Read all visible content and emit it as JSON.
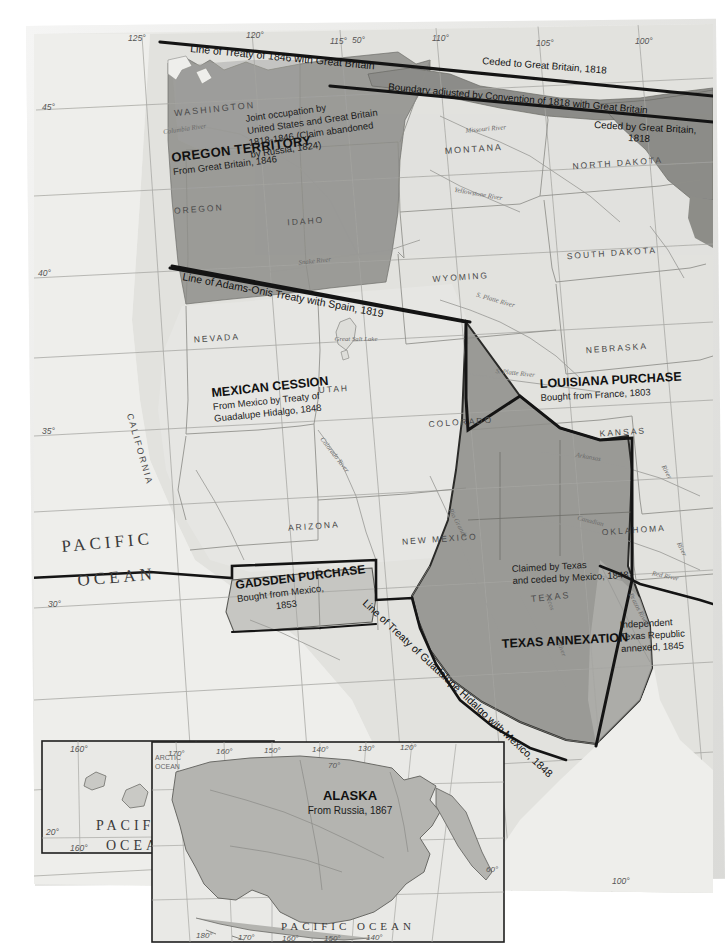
{
  "map": {
    "title": "United States Territorial Expansion",
    "colors": {
      "paper": "#e9e9e7",
      "land_light": "#e3e3e0",
      "land_mid": "#c9c9c5",
      "territory_dark": "#9a9a96",
      "territory_darker": "#8c8c88",
      "water": "#efefec",
      "boundary_heavy": "#111111",
      "state_line": "#8a8a86",
      "grid_line": "#9a9a96",
      "river": "#8f8f8b",
      "text": "#1a1a1a",
      "state_text": "#4a4a4a"
    },
    "territories": [
      {
        "id": "oregon-territory",
        "title": "OREGON TERRITORY",
        "subtitle": "From Great Britain, 1846",
        "shade": "dark"
      },
      {
        "id": "joint-occupation-note",
        "title": "Joint occupation by",
        "lines": [
          "Joint occupation by",
          "United States and Great Britain",
          "1818-1846 (Claim abandoned",
          "by Russia, 1824)"
        ],
        "shade": "note"
      },
      {
        "id": "mexican-cession",
        "title": "MEXICAN CESSION",
        "subtitle_lines": [
          "From Mexico by Treaty of",
          "Guadalupe Hidalgo, 1848"
        ],
        "shade": "light"
      },
      {
        "id": "louisiana-purchase",
        "title": "LOUISIANA PURCHASE",
        "subtitle": "Bought from France, 1803",
        "shade": "light"
      },
      {
        "id": "gadsden-purchase",
        "title": "GADSDEN PURCHASE",
        "subtitle_lines": [
          "Bought from Mexico,",
          "1853"
        ],
        "shade": "mid"
      },
      {
        "id": "texas-annexation",
        "title": "TEXAS ANNEXATION",
        "subtitle_lines": [
          "Independent",
          "Texas Republic",
          "annexed, 1845"
        ],
        "shade": "dark"
      },
      {
        "id": "claimed-by-texas",
        "lines": [
          "Claimed by Texas",
          "and ceded by Mexico, 1848"
        ],
        "shade": "dark"
      },
      {
        "id": "hawaii",
        "title": "HAWAII",
        "subtitle": "Annexed, 1898",
        "shade": "inset"
      },
      {
        "id": "alaska",
        "title": "ALASKA",
        "subtitle": "From Russia, 1867",
        "shade": "inset"
      }
    ],
    "boundary_annotations": [
      {
        "id": "treaty-1846",
        "text": "Line of Treaty of 1846 with Great Britain"
      },
      {
        "id": "ceded-to-gb-1818",
        "text": "Ceded to Great Britain, 1818"
      },
      {
        "id": "convention-1818",
        "text": "Boundary adjusted by Convention of 1818 with Great Britain"
      },
      {
        "id": "ceded-by-gb-1818",
        "lines": [
          "Ceded by Great Britain,",
          "1818"
        ]
      },
      {
        "id": "adams-onis-1819",
        "text": "Line of Adams-Onis Treaty with Spain, 1819"
      },
      {
        "id": "guadalupe-hidalgo-1848",
        "text": "Line of Treaty of Guadalupe Hidalgo with Mexico, 1848"
      }
    ],
    "states": [
      {
        "name": "WASHINGTON",
        "x": 215,
        "y": 112,
        "rot": -6,
        "size": 9
      },
      {
        "name": "OREGON",
        "x": 199,
        "y": 212,
        "rot": -4,
        "size": 8.5
      },
      {
        "name": "IDAHO",
        "x": 306,
        "y": 224,
        "rot": -4,
        "size": 8.5
      },
      {
        "name": "MONTANA",
        "x": 474,
        "y": 152,
        "rot": -4,
        "size": 9
      },
      {
        "name": "NORTH DAKOTA",
        "x": 618,
        "y": 166,
        "rot": -4,
        "size": 8.5
      },
      {
        "name": "SOUTH DAKOTA",
        "x": 612,
        "y": 256,
        "rot": -4,
        "size": 8.5
      },
      {
        "name": "WYOMING",
        "x": 461,
        "y": 280,
        "rot": -4,
        "size": 8.5
      },
      {
        "name": "NEBRASKA",
        "x": 617,
        "y": 351,
        "rot": -4,
        "size": 8.5
      },
      {
        "name": "NEVADA",
        "x": 217,
        "y": 341,
        "rot": -4,
        "size": 8.5
      },
      {
        "name": "UTAH",
        "x": 334,
        "y": 392,
        "rot": -4,
        "size": 8.5
      },
      {
        "name": "COLORADO",
        "x": 461,
        "y": 425,
        "rot": -4,
        "size": 8.5
      },
      {
        "name": "KANSAS",
        "x": 623,
        "y": 435,
        "rot": -4,
        "size": 8.5
      },
      {
        "name": "ARIZONA",
        "x": 314,
        "y": 529,
        "rot": -4,
        "size": 8.5
      },
      {
        "name": "NEW MEXICO",
        "x": 440,
        "y": 542,
        "rot": -4,
        "size": 8.5
      },
      {
        "name": "OKLAHOMA",
        "x": 634,
        "y": 533,
        "rot": -4,
        "size": 8.5
      },
      {
        "name": "CALIFORNIA",
        "x": 137,
        "y": 450,
        "rot": 74,
        "size": 9
      },
      {
        "name": "TEXAS",
        "x": 551,
        "y": 600,
        "rot": -6,
        "size": 9
      }
    ],
    "rivers": [
      {
        "name": "Columbia River",
        "x": 185,
        "y": 131,
        "rot": -8
      },
      {
        "name": "Snake River",
        "x": 315,
        "y": 263,
        "rot": -6
      },
      {
        "name": "Yellowstone River",
        "x": 478,
        "y": 196,
        "rot": 10
      },
      {
        "name": "Missouri River",
        "x": 486,
        "y": 131,
        "rot": -5
      },
      {
        "name": "S. Platte River",
        "x": 495,
        "y": 302,
        "rot": 16
      },
      {
        "name": "S. Platte River",
        "x": 515,
        "y": 375,
        "rot": 6
      },
      {
        "name": "Colorado River",
        "x": 333,
        "y": 456,
        "rot": 52
      },
      {
        "name": "Rio Grande",
        "x": 456,
        "y": 524,
        "rot": 62
      },
      {
        "name": "Arkansas",
        "x": 588,
        "y": 459,
        "rot": 10
      },
      {
        "name": "River",
        "x": 665,
        "y": 473,
        "rot": 62
      },
      {
        "name": "Canadian",
        "x": 590,
        "y": 523,
        "rot": 14
      },
      {
        "name": "River",
        "x": 680,
        "y": 550,
        "rot": 64
      },
      {
        "name": "Red River",
        "x": 665,
        "y": 578,
        "rot": 12
      },
      {
        "name": "Brazos River",
        "x": 637,
        "y": 610,
        "rot": 62
      },
      {
        "name": "Pecos",
        "x": 548,
        "y": 603,
        "rot": 70
      },
      {
        "name": "River",
        "x": 560,
        "y": 650,
        "rot": 70
      },
      {
        "name": "Great Salt Lake",
        "x": 356,
        "y": 341,
        "rot": 0
      }
    ],
    "oceans": [
      {
        "name": "PACIFIC",
        "x": 62,
        "y": 546,
        "size": 17
      },
      {
        "name": "OCEAN",
        "x": 76,
        "y": 578,
        "size": 17
      }
    ],
    "grid_labels": [
      {
        "text": "125°",
        "x": 128,
        "y": 41
      },
      {
        "text": "120°",
        "x": 246,
        "y": 38
      },
      {
        "text": "115°",
        "x": 330,
        "y": 44
      },
      {
        "text": "50°",
        "x": 352,
        "y": 43
      },
      {
        "text": "110°",
        "x": 432,
        "y": 41
      },
      {
        "text": "105°",
        "x": 536,
        "y": 46
      },
      {
        "text": "100°",
        "x": 635,
        "y": 44
      },
      {
        "text": "45°",
        "x": 42,
        "y": 110
      },
      {
        "text": "40°",
        "x": 38,
        "y": 276
      },
      {
        "text": "35°",
        "x": 42,
        "y": 434
      },
      {
        "text": "30°",
        "x": 48,
        "y": 607
      },
      {
        "text": "100°",
        "x": 612,
        "y": 884
      }
    ],
    "insets": {
      "hawaii": {
        "title": "HAWAII",
        "subtitle": "Annexed, 1898",
        "ocean_lines": [
          "PACIFIC",
          "OCEAN"
        ],
        "grid_labels": [
          "160°",
          "155°",
          "20°",
          "20°",
          "160°",
          "155°"
        ],
        "credit": "© MAPS"
      },
      "alaska": {
        "title": "ALASKA",
        "subtitle": "From Russia, 1867",
        "ocean_label_lines": [
          "ARCTIC",
          "OCEAN"
        ],
        "bottom_ocean": "PACIFIC OCEAN",
        "grid_labels": [
          "170°",
          "160°",
          "150°",
          "140°",
          "130°",
          "120°",
          "70°",
          "60°",
          "180°",
          "170°",
          "160°",
          "150°",
          "140°"
        ]
      }
    }
  }
}
